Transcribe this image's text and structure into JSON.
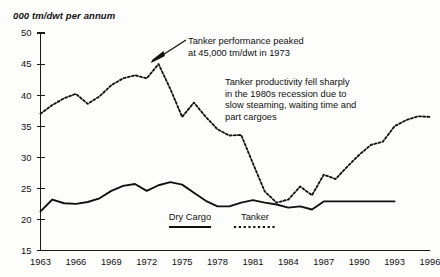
{
  "chart_data": {
    "type": "line",
    "title": "000 tm/dwt per annum",
    "xlabel": "",
    "ylabel": "000 tm/dwt per annum",
    "xlim": [
      1963,
      1996
    ],
    "ylim": [
      15,
      50
    ],
    "yticks": [
      15,
      20,
      25,
      30,
      35,
      40,
      45,
      50
    ],
    "xticks": [
      1963,
      1966,
      1969,
      1972,
      1975,
      1978,
      1981,
      1984,
      1987,
      1990,
      1993,
      1996
    ],
    "grid": false,
    "legend_position": "bottom-center",
    "x": [
      1963,
      1964,
      1965,
      1966,
      1967,
      1968,
      1969,
      1970,
      1971,
      1972,
      1973,
      1974,
      1975,
      1976,
      1977,
      1978,
      1979,
      1980,
      1981,
      1982,
      1983,
      1984,
      1985,
      1986,
      1987,
      1988,
      1989,
      1990,
      1991,
      1992,
      1993,
      1994,
      1995,
      1996
    ],
    "series": [
      {
        "name": "Dry Cargo",
        "style": "solid",
        "x": [
          1963,
          1964,
          1965,
          1966,
          1967,
          1968,
          1969,
          1970,
          1971,
          1972,
          1973,
          1974,
          1975,
          1976,
          1977,
          1978,
          1979,
          1980,
          1981,
          1982,
          1983,
          1984,
          1985,
          1986,
          1987,
          1988,
          1989,
          1990,
          1991,
          1992,
          1993
        ],
        "values": [
          21.3,
          23.2,
          22.6,
          22.5,
          22.8,
          23.4,
          24.6,
          25.4,
          25.7,
          24.6,
          25.5,
          26.0,
          25.6,
          24.3,
          23.0,
          22.1,
          22.1,
          22.7,
          23.1,
          22.7,
          22.4,
          21.9,
          22.1,
          21.6,
          22.9,
          22.9,
          22.9,
          22.9,
          22.9,
          22.9,
          22.9
        ]
      },
      {
        "name": "Tanker",
        "style": "dashed",
        "x": [
          1963,
          1964,
          1965,
          1966,
          1967,
          1968,
          1969,
          1970,
          1971,
          1972,
          1973,
          1974,
          1975,
          1976,
          1977,
          1978,
          1979,
          1980,
          1981,
          1982,
          1983,
          1984,
          1985,
          1986,
          1987,
          1988,
          1989,
          1990,
          1991,
          1992,
          1993,
          1994,
          1995,
          1996
        ],
        "values": [
          37.0,
          38.4,
          39.5,
          40.2,
          38.6,
          39.8,
          41.6,
          42.7,
          43.2,
          42.7,
          45.0,
          41.0,
          36.5,
          38.8,
          36.5,
          34.5,
          33.5,
          33.6,
          29.0,
          24.5,
          22.7,
          23.2,
          25.3,
          23.9,
          27.2,
          26.5,
          28.5,
          30.4,
          32.0,
          32.5,
          35.0,
          36.0,
          36.6,
          36.5
        ]
      }
    ],
    "annotations": [
      {
        "name": "peak-callout",
        "lines": [
          "Tanker performance peaked",
          "at 45,000 tm/dwt in 1973"
        ],
        "points_to_year": 1973,
        "points_to_value": 45
      },
      {
        "name": "recession-note",
        "lines": [
          "Tanker productivity fell sharply",
          "in the 1980s recession due to",
          "slow steaming, waiting time and",
          "part cargoes"
        ]
      }
    ]
  },
  "legend": {
    "items": [
      {
        "label": "Dry Cargo",
        "style": "solid"
      },
      {
        "label": "Tanker",
        "style": "dashed"
      }
    ]
  },
  "colors": {
    "ink": "#111111",
    "background": "#fdfdfc"
  }
}
